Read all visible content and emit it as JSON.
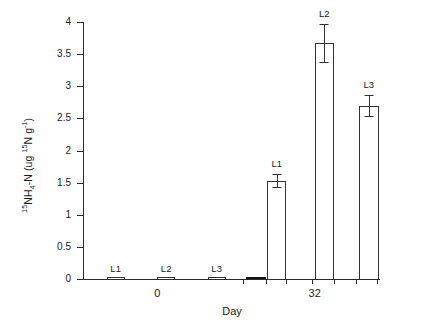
{
  "chart_data": {
    "type": "bar",
    "title": "",
    "xlabel": "Day",
    "ylabel": "15NH4-N (ug 15N g-1)",
    "ylabel_parts": {
      "pre_sup": "15",
      "base1": "NH",
      "sub": "4",
      "base2": "-N (ug ",
      "sup2": "15",
      "base3": "N g",
      "sup3": "-1",
      "base4": ")"
    },
    "ylim": [
      0,
      4
    ],
    "yticks": [
      0,
      0.5,
      1,
      1.5,
      2,
      2.5,
      3,
      3.5,
      4
    ],
    "ytick_labels": [
      "0",
      "0.5",
      "1",
      "1.5",
      "2",
      "2.5",
      "3",
      "3.5",
      "4"
    ],
    "grid": false,
    "legend": false,
    "groups": [
      "0",
      "32"
    ],
    "categories": [
      "L1",
      "L2",
      "L3"
    ],
    "series": [
      {
        "name": "Day 0",
        "group": "0",
        "values": [
          0,
          0,
          0
        ],
        "errors": [
          0,
          0,
          0
        ]
      },
      {
        "name": "Day 32",
        "group": "32",
        "values": [
          1.53,
          3.67,
          2.7
        ],
        "errors": [
          0.1,
          0.3,
          0.17
        ]
      }
    ],
    "bars": [
      {
        "id": "d0-l1",
        "group": "0",
        "category": "L1",
        "value": 0,
        "error": 0,
        "label": "L1",
        "label_shown": true,
        "filled": false,
        "left_pct": 8.0,
        "width_pct": 6.0
      },
      {
        "id": "d0-l2",
        "group": "0",
        "category": "L2",
        "value": 0,
        "error": 0,
        "label": "L2",
        "label_shown": true,
        "filled": false,
        "left_pct": 25.0,
        "width_pct": 6.0
      },
      {
        "id": "d0-l3",
        "group": "0",
        "category": "L3",
        "value": 0,
        "error": 0,
        "label": "L3",
        "label_shown": true,
        "filled": false,
        "left_pct": 42.0,
        "width_pct": 6.0
      },
      {
        "id": "d32-marker",
        "group": "32",
        "category": "",
        "value": 0.01,
        "error": 0,
        "label": "",
        "label_shown": false,
        "filled": true,
        "left_pct": 55.0,
        "width_pct": 6.5
      },
      {
        "id": "d32-l1",
        "group": "32",
        "category": "L1",
        "value": 1.53,
        "error": 0.1,
        "label": "L1",
        "label_shown": true,
        "filled": false,
        "left_pct": 62.0,
        "width_pct": 6.5
      },
      {
        "id": "d32-l2",
        "group": "32",
        "category": "L2",
        "value": 3.67,
        "error": 0.3,
        "label": "L2",
        "label_shown": true,
        "filled": false,
        "left_pct": 78.0,
        "width_pct": 6.5
      },
      {
        "id": "d32-l3",
        "group": "32",
        "category": "L3",
        "value": 2.7,
        "error": 0.17,
        "label": "L3",
        "label_shown": true,
        "filled": false,
        "left_pct": 93.0,
        "width_pct": 6.5
      }
    ],
    "xticks_pct": [
      54.0,
      61.5,
      68.5,
      77.0,
      84.5,
      92.0,
      99.0
    ],
    "group_label_pos_pct": [
      25.0,
      78.0
    ],
    "colors": {
      "axis": "#2b2b2b",
      "bar_edge": "#333333",
      "bar_fill": "#ffffff",
      "bar_fill_solid": "#111111",
      "text": "#1a1a1a",
      "background": "#ffffff"
    }
  }
}
